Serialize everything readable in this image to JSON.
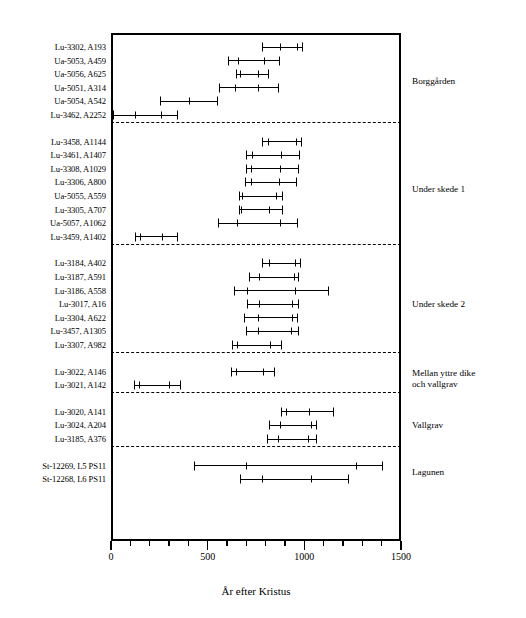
{
  "chart_data": {
    "type": "errorbar",
    "title": "",
    "xlabel": "År efter Kristus",
    "ylabel": "",
    "xlim": [
      0,
      1500
    ],
    "xticks": [
      0,
      500,
      1000,
      1500
    ],
    "xticklabels": [
      "0",
      "500",
      "1000",
      "1500"
    ],
    "minor_tick_step": 100,
    "grid": false,
    "orientation": "horizontal",
    "groups": [
      {
        "name": "Borggården",
        "rows": [
          {
            "label": "Lu-3302, A193",
            "low": 780,
            "high": 995,
            "ticks": [
              875,
              960
            ]
          },
          {
            "label": "Ua-5053, A459",
            "low": 605,
            "high": 875,
            "ticks": [
              655,
              790
            ]
          },
          {
            "label": "Ua-5056, A625",
            "low": 645,
            "high": 815,
            "ticks": [
              668,
              760
            ]
          },
          {
            "label": "Ua-5051, A314",
            "low": 560,
            "high": 870,
            "ticks": [
              640,
              760
            ]
          },
          {
            "label": "Ua-5054, A542",
            "low": 255,
            "high": 555,
            "ticks": [
              405
            ]
          },
          {
            "label": "Lu-3462, A2252",
            "low": 10,
            "high": 345,
            "ticks": [
              125,
              260
            ]
          }
        ]
      },
      {
        "name": "Under skede 1",
        "rows": [
          {
            "label": "Lu-3458, A1144",
            "low": 780,
            "high": 990,
            "ticks": [
              812,
              955
            ]
          },
          {
            "label": "Lu-3461, A1407",
            "low": 700,
            "high": 980,
            "ticks": [
              728,
              880
            ]
          },
          {
            "label": "Lu-3308, A1029",
            "low": 700,
            "high": 970,
            "ticks": [
              726,
              875
            ]
          },
          {
            "label": "Lu-3306, A800",
            "low": 695,
            "high": 960,
            "ticks": [
              722,
              870
            ]
          },
          {
            "label": "Ua-5055, A559",
            "low": 660,
            "high": 890,
            "ticks": [
              678,
              855
            ]
          },
          {
            "label": "Lu-3305, A707",
            "low": 660,
            "high": 890,
            "ticks": [
              672,
              818
            ]
          },
          {
            "label": "Ua-5057, A1062",
            "low": 555,
            "high": 965,
            "ticks": [
              650,
              872
            ]
          },
          {
            "label": "Lu-3459, A1402",
            "low": 125,
            "high": 345,
            "ticks": [
              148,
              262
            ]
          }
        ]
      },
      {
        "name": "Under skede 2",
        "rows": [
          {
            "label": "Lu-3184, A402",
            "low": 780,
            "high": 985,
            "ticks": [
              818,
              950
            ]
          },
          {
            "label": "Lu-3187, A591",
            "low": 715,
            "high": 975,
            "ticks": [
              768,
              945
            ]
          },
          {
            "label": "Lu-3186, A558",
            "low": 635,
            "high": 1130,
            "ticks": [
              705,
              952
            ]
          },
          {
            "label": "Lu-3017, A16",
            "low": 705,
            "high": 975,
            "ticks": [
              768,
              935
            ]
          },
          {
            "label": "Lu-3304, A622",
            "low": 690,
            "high": 965,
            "ticks": [
              758,
              935
            ]
          },
          {
            "label": "Lu-3457, A1305",
            "low": 700,
            "high": 970,
            "ticks": [
              760,
              930
            ]
          },
          {
            "label": "Lu-3307, A982",
            "low": 628,
            "high": 885,
            "ticks": [
              652,
              825
            ]
          }
        ]
      },
      {
        "name": "Mellan yttre dike\noch vallgrav",
        "name_line1": "Mellan yttre dike",
        "name_line2": "och vallgrav",
        "rows": [
          {
            "label": "Lu-3022, A146",
            "low": 620,
            "high": 850,
            "ticks": [
              645,
              785
            ]
          },
          {
            "label": "Lu-3021, A142",
            "low": 120,
            "high": 360,
            "ticks": [
              145,
              300
            ]
          }
        ]
      },
      {
        "name": "Vallgrav",
        "rows": [
          {
            "label": "Lu-3020, A141",
            "low": 880,
            "high": 1155,
            "ticks": [
              905,
              1022
            ]
          },
          {
            "label": "Lu-3024, A204",
            "low": 815,
            "high": 1065,
            "ticks": [
              872,
              1035
            ]
          },
          {
            "label": "Lu-3185, A376",
            "low": 805,
            "high": 1065,
            "ticks": [
              862,
              1020
            ]
          }
        ]
      },
      {
        "name": "Lagunen",
        "rows": [
          {
            "label": "St-12269, L5 PS11",
            "low": 430,
            "high": 1405,
            "ticks": [
              700,
              1265
            ]
          },
          {
            "label": "St-12268, L6 PS11",
            "low": 665,
            "high": 1230,
            "ticks": [
              782,
              1035
            ]
          }
        ]
      }
    ]
  },
  "axis": {
    "xlabel": "År efter Kristus",
    "ticklabels": [
      "0",
      "500",
      "1000",
      "1500"
    ]
  },
  "colors": {
    "line": "#000000",
    "background": "#ffffff"
  }
}
